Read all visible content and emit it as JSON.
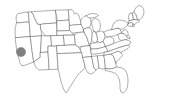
{
  "figure": {
    "type": "map",
    "width": 173,
    "height": 106,
    "background_color": "#ffffff"
  },
  "map": {
    "region": "United States (contiguous 48 states)",
    "projection_style": "flat outline",
    "outline_color": "#4d4d4d",
    "fill_color": "#ffffff",
    "stroke_width": 0.45,
    "bounds": {
      "x": 12,
      "y": 8,
      "width": 153,
      "height": 90
    }
  },
  "markers": [
    {
      "name": "california-marker",
      "label": "California",
      "shape": "circle",
      "cx": 21.0,
      "cy": 52.0,
      "r": 4.6,
      "fill_color": "#808080",
      "stroke_color": "#6b6b6b"
    }
  ],
  "legend": {
    "visible": false,
    "entries": []
  },
  "labels": {
    "visible": false,
    "entries": []
  }
}
